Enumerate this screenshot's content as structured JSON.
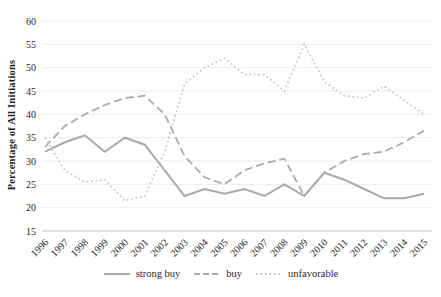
{
  "chart_data": {
    "type": "line",
    "title": "",
    "xlabel": "",
    "ylabel": "Percentage of All Initiations",
    "ylim": [
      15,
      60
    ],
    "yticks": [
      15,
      20,
      25,
      30,
      35,
      40,
      45,
      50,
      55,
      60
    ],
    "grid": "horizontal",
    "legend_position": "bottom-center",
    "categories": [
      "1996",
      "1997",
      "1998",
      "1999",
      "2000",
      "2001",
      "2002",
      "2003",
      "2004",
      "2005",
      "2006",
      "2007",
      "2008",
      "2009",
      "2010",
      "2011",
      "2012",
      "2013",
      "2014",
      "2015"
    ],
    "series": [
      {
        "name": "strong buy",
        "style": "solid",
        "color": "#a9a9a9",
        "values": [
          32,
          34,
          35.5,
          32,
          35,
          33.5,
          28,
          22.5,
          24,
          23,
          24,
          22.5,
          25,
          22.5,
          27.5,
          26,
          24,
          22,
          22,
          23
        ]
      },
      {
        "name": "buy",
        "style": "dashed",
        "color": "#ababab",
        "values": [
          33,
          37.5,
          40,
          42,
          43.5,
          44,
          40,
          31,
          26.5,
          25,
          28,
          29.5,
          30.5,
          22.5,
          27.5,
          30,
          31.5,
          32,
          34,
          36.5
        ]
      },
      {
        "name": "unfavorable",
        "style": "dotted",
        "color": "#c6c6c6",
        "values": [
          35,
          28,
          25.5,
          26,
          21.5,
          22.5,
          32,
          46.5,
          50,
          52,
          48.5,
          48.5,
          45,
          55,
          47,
          44,
          43.5,
          46,
          43,
          40
        ]
      }
    ],
    "colors": {
      "grid": "#ececec",
      "axis": "#bfbfbf",
      "text": "#1f1f1f",
      "background": "#ffffff"
    }
  }
}
